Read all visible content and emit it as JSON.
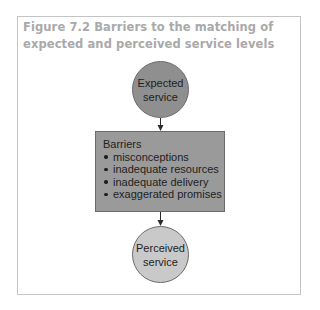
{
  "figure": {
    "title_line1": "Figure 7.2 Barriers to the matching of",
    "title_line2": "expected and perceived service levels",
    "colors": {
      "title": "#a9a9a9",
      "frame_border": "#c4c4c4",
      "expected_fill": "#8f8f8f",
      "barrier_fill": "#9a9a9a",
      "perceived_fill": "#c9c9c9",
      "outline": "#6a6a6a",
      "text": "#1e1e1e"
    }
  },
  "nodes": {
    "expected": {
      "line1": "Expected",
      "line2": "service"
    },
    "barriers": {
      "heading": "Barriers",
      "items": [
        "misconceptions",
        "inadequate resources",
        "inadequate delivery",
        "exaggerated promises"
      ]
    },
    "perceived": {
      "line1": "Perceived",
      "line2": "service"
    }
  },
  "edges": [
    {
      "from": "expected",
      "to": "barriers"
    },
    {
      "from": "barriers",
      "to": "perceived"
    }
  ]
}
